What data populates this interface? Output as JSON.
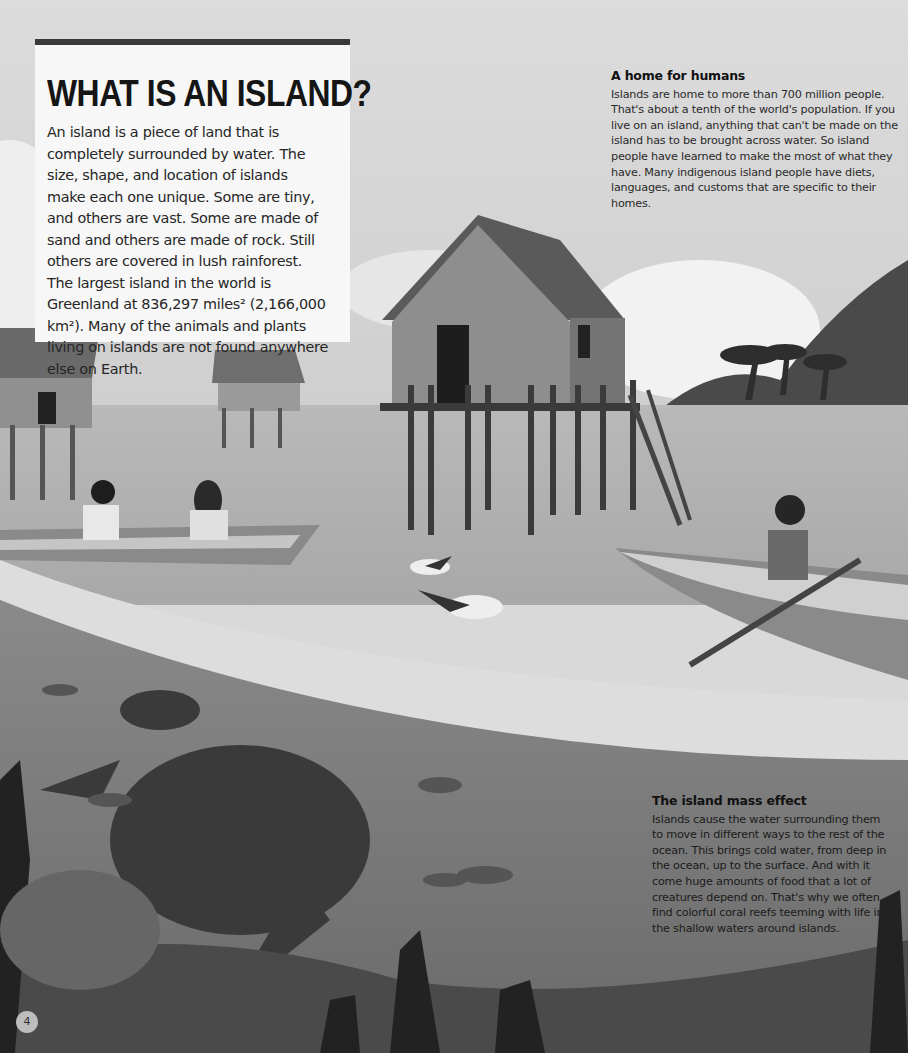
{
  "intro": {
    "title": "WHAT IS AN ISLAND?",
    "body": "An island is a piece of land that is completely surrounded by water. The size, shape, and location of islands make each one unique. Some are tiny, and others are vast. Some are made of sand and others are made of rock. Still others are covered in lush rainforest. The largest island in the world is Greenland at 836,297 miles² (2,166,000 km²). Many of the animals and plants living on islands are not found anywhere else on Earth."
  },
  "sidebars": [
    {
      "heading": "A home for humans",
      "body": "Islands are home to more than 700 million people. That's about a tenth of the world's population. If you live on an island, anything that can't be made on the island has to be brought across water. So island people have learned to make the most of what they have. Many indigenous island people have diets, languages, and customs that are specific to their homes."
    },
    {
      "heading": "The island mass effect",
      "body": "Islands cause the water surrounding them to move in different ways to the rest of the ocean. This brings cold water, from deep in the ocean, up to the surface. And with it come huge amounts of food that a lot of creatures depend on. That's why we often find colorful coral reefs teeming with life in the shallow waters around islands."
    }
  ],
  "page": {
    "number": "4"
  }
}
